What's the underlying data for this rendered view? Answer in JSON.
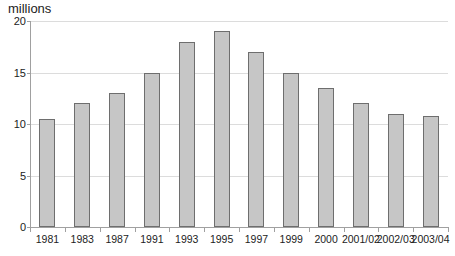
{
  "chart_data": {
    "type": "bar",
    "title": "",
    "xlabel": "",
    "ylabel": "millions",
    "categories": [
      "1981",
      "1983",
      "1987",
      "1991",
      "1993",
      "1995",
      "1997",
      "1999",
      "2000",
      "2001/02",
      "2002/03",
      "2003/04"
    ],
    "values": [
      10.5,
      12,
      13,
      15,
      18,
      19,
      17,
      15,
      13.5,
      12,
      11,
      10.8
    ],
    "ylim": [
      0,
      20
    ],
    "yticks": [
      0,
      5,
      10,
      15,
      20
    ],
    "grid": "horizontal-on",
    "legend": "none",
    "colors": {
      "bar_fill": "#c6c6c6",
      "bar_border": "#6e6e6e",
      "gridline": "#dcdcdc",
      "axis": "#a0a0a0",
      "text": "#1c1c1c",
      "background": "#ffffff"
    }
  }
}
